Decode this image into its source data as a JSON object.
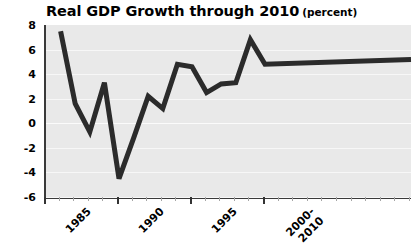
{
  "chart_data": {
    "type": "line",
    "title": "Real GDP Growth through 2010",
    "subtitle": "(percent)",
    "xlabel": "",
    "ylabel": "",
    "grid": true,
    "legend": "none",
    "line_color": "#2b2b2b",
    "plot_background": "#e9e9e9",
    "gridline_color": "#f7f7f7",
    "axis_color": "#3a3a3a",
    "ylim": [
      -6,
      8
    ],
    "xlim": [
      1985,
      2010
    ],
    "y_ticks": [
      8,
      6,
      4,
      2,
      0,
      -2,
      -4,
      -6
    ],
    "y_tick_labels": [
      "8",
      "6",
      "4",
      "2",
      "0",
      "-2",
      "-4",
      "-6"
    ],
    "x_ticks": [
      1985,
      1990,
      1995,
      2000
    ],
    "x_tick_labels": [
      "1985",
      "1990",
      "1995",
      "2000-"
    ],
    "x_tick_labels_line2": [
      "",
      "",
      "",
      "2010"
    ],
    "x_minor_ticks": [
      1986,
      1987,
      1988,
      1989,
      1991,
      1992,
      1993,
      1994,
      1996,
      1997,
      1998,
      1999,
      2001,
      2002,
      2003,
      2004,
      2005,
      2006,
      2007,
      2008,
      2009,
      2010
    ],
    "x": [
      1986,
      1987,
      1988,
      1989,
      1990,
      1991,
      1992,
      1993,
      1994,
      1995,
      1996,
      1997,
      1998,
      1999,
      2000,
      2010
    ],
    "values": [
      7.5,
      1.6,
      -0.7,
      3.3,
      -4.5,
      -1.2,
      2.2,
      1.2,
      4.8,
      4.6,
      2.5,
      3.2,
      3.3,
      6.8,
      4.8,
      5.2
    ],
    "series": [
      {
        "name": "Real GDP Growth",
        "values": [
          7.5,
          1.6,
          -0.7,
          3.3,
          -4.5,
          -1.2,
          2.2,
          1.2,
          4.8,
          4.6,
          2.5,
          3.2,
          3.3,
          6.8,
          4.8,
          5.2
        ]
      }
    ]
  }
}
